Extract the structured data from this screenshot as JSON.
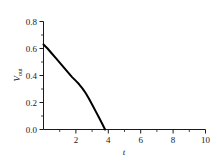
{
  "chart_data": {
    "type": "line",
    "title": "",
    "xlabel": "t",
    "ylabel": "V_out",
    "ylabel_main": "V",
    "ylabel_sub": "out",
    "xlim": [
      0,
      10
    ],
    "ylim": [
      0.0,
      0.8
    ],
    "grid": false,
    "legend": null,
    "x_ticks": [
      0,
      2,
      4,
      6,
      8,
      10
    ],
    "x_tick_labels": [
      "",
      "2",
      "4",
      "6",
      "8",
      "10"
    ],
    "y_ticks": [
      0.0,
      0.2,
      0.4,
      0.6,
      0.8
    ],
    "y_tick_labels": [
      "0.0",
      "0.2",
      "0.4",
      "0.6",
      "0.8"
    ],
    "x_minor_ticks": [
      1,
      3,
      5,
      7,
      9
    ],
    "y_minor_ticks": [
      0.1,
      0.3,
      0.5,
      0.7
    ],
    "series": [
      {
        "name": "V_out",
        "color": "#000000",
        "x": [
          0.0,
          0.25,
          0.5,
          0.75,
          1.0,
          1.25,
          1.5,
          1.75,
          2.0,
          2.2,
          2.4,
          2.6,
          2.8,
          3.0,
          3.2,
          3.4,
          3.6,
          3.8
        ],
        "y": [
          0.63,
          0.6,
          0.565,
          0.53,
          0.495,
          0.46,
          0.425,
          0.39,
          0.36,
          0.335,
          0.305,
          0.27,
          0.23,
          0.185,
          0.14,
          0.095,
          0.048,
          0.0
        ]
      }
    ]
  },
  "labels": {
    "y_0_0": "0.0",
    "y_0_2": "0.2",
    "y_0_4": "0.4",
    "y_0_6": "0.6",
    "y_0_8": "0.8",
    "x_2": "2",
    "x_4": "4",
    "x_6": "6",
    "x_8": "8",
    "x_10": "10",
    "x_axis_title": "t",
    "y_axis_title_main": "V",
    "y_axis_title_sub": "out"
  }
}
